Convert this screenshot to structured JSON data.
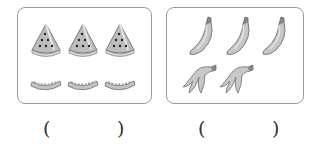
{
  "groups": [
    {
      "name": "watermelon",
      "slices_count": 3,
      "rinds_count": 3,
      "answer": ""
    },
    {
      "name": "banana",
      "whole_count": 3,
      "peels_count": 2,
      "answer": ""
    }
  ],
  "answer_blanks": [
    {
      "open": "(",
      "close": ")",
      "value": ""
    },
    {
      "open": "(",
      "close": ")",
      "value": ""
    }
  ]
}
